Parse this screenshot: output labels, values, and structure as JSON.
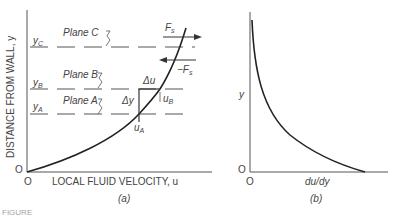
{
  "panel_a": {
    "caption": "(a)",
    "y_axis_label": "DISTANCE FROM WALL, y",
    "x_axis_label": "LOCAL FLUID VELOCITY, u",
    "origin_x": "O",
    "origin_y": "O",
    "planes": [
      {
        "level": "yC",
        "sub": "C",
        "label": "Plane C"
      },
      {
        "level": "yB",
        "sub": "B",
        "label": "Plane B"
      },
      {
        "level": "yA",
        "sub": "A",
        "label": "Plane A"
      }
    ],
    "annotations": {
      "force": "Fs",
      "neg_force": "-Fs",
      "delta_u": "Δu",
      "delta_y": "Δy",
      "u_a": "uA",
      "u_b": "uB"
    }
  },
  "panel_b": {
    "caption": "(b)",
    "y_axis_label": "y",
    "x_axis_label": "du/dy",
    "origin_x": "O",
    "origin_y": "O"
  },
  "figure_label": "FIGURE"
}
